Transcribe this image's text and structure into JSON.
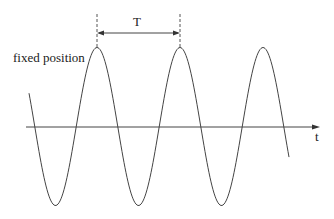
{
  "diagram": {
    "label_fixed_position": "fixed position",
    "label_period": "T",
    "label_time_axis": "t",
    "wave": {
      "type": "sine",
      "period_px": 83,
      "amplitude_px": 79,
      "peaks_x": [
        97,
        180,
        263
      ]
    },
    "colors": {
      "line": "#444444",
      "background": "#ffffff"
    }
  }
}
